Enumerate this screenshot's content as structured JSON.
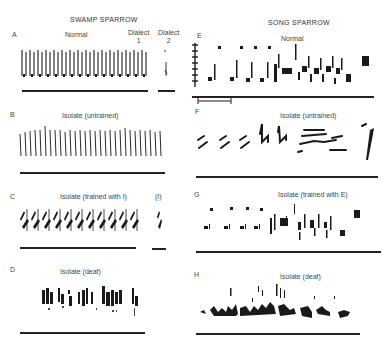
{
  "figure": {
    "left_column": {
      "title": "SWAMP SPARROW",
      "panels": [
        {
          "letter": "A",
          "label": "Normal",
          "extra_labels": [
            "Dialect 1",
            "Dialect 2"
          ]
        },
        {
          "letter": "B",
          "label": "Isolate (untrained)"
        },
        {
          "letter": "C",
          "label": "Isolate (trained with I)",
          "extra_label": "(I)"
        },
        {
          "letter": "D",
          "label": "Isolate (deaf)"
        }
      ]
    },
    "right_column": {
      "title": "SONG SPARROW",
      "panels": [
        {
          "letter": "E",
          "label": "Normal"
        },
        {
          "letter": "F",
          "label": "Isolate (untrained)"
        },
        {
          "letter": "G",
          "label": "Isolate (trained with E)"
        },
        {
          "letter": "H",
          "label": "Isolate (deaf)"
        }
      ]
    },
    "dialect1_line1": "Dialect",
    "dialect1_line2": "1",
    "dialect2_line1": "Dialect",
    "dialect2_line2": "2",
    "colors": {
      "ink": "#1a1a1a",
      "background": "#ffffff"
    }
  }
}
